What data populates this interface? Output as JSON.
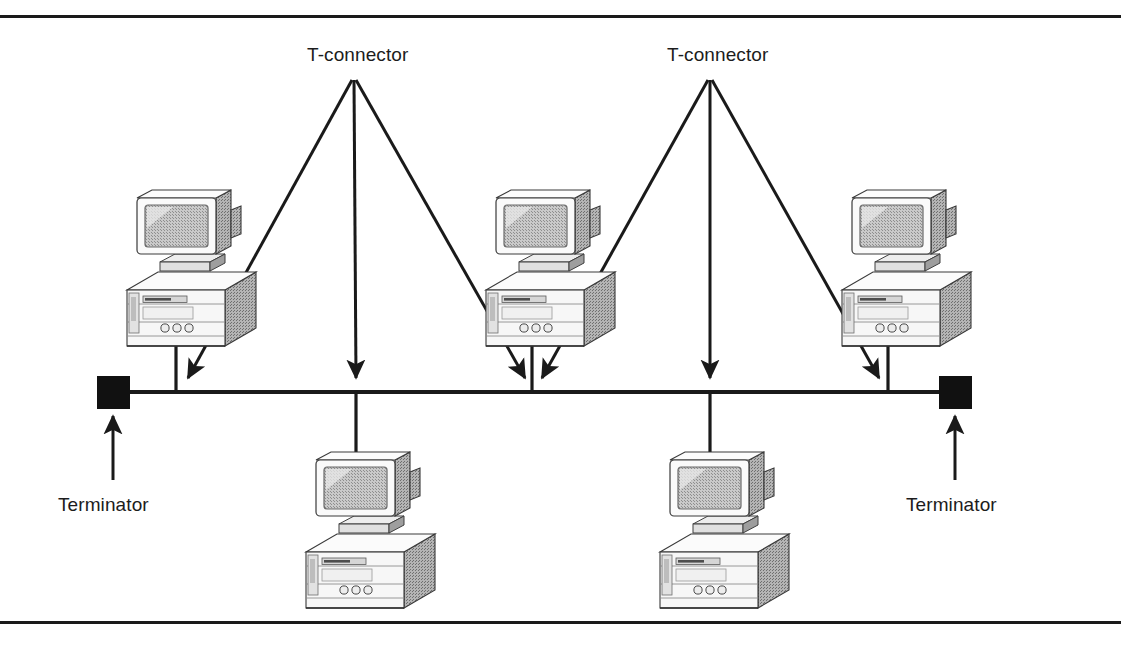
{
  "figure": {
    "background_color": "#ffffff",
    "line_color": "#1a1a1a",
    "border": {
      "top_rule": true,
      "bottom_rule": true
    }
  },
  "labels": {
    "t_connector_left": "T-connector",
    "t_connector_right": "T-connector",
    "terminator_left": "Terminator",
    "terminator_right": "Terminator"
  },
  "diagram_data": {
    "type": "network-topology",
    "topology": "bus",
    "bus": {
      "y": 392,
      "x_start": 113,
      "x_end": 948,
      "stroke_width": 4
    },
    "terminators": [
      {
        "name": "terminator-left",
        "x": 97,
        "y": 376,
        "size": 33,
        "fill": "#111111"
      },
      {
        "name": "terminator-right",
        "x": 939,
        "y": 376,
        "size": 33,
        "fill": "#111111"
      }
    ],
    "computers": [
      {
        "name": "computer-top-left",
        "x": 113,
        "y": 190,
        "row": "top",
        "drop_x": 176,
        "drop_from_y": 330,
        "drop_to_y": 392
      },
      {
        "name": "computer-top-middle",
        "x": 478,
        "y": 190,
        "row": "top",
        "drop_x": 532,
        "drop_from_y": 330,
        "drop_to_y": 392
      },
      {
        "name": "computer-top-right",
        "x": 833,
        "y": 190,
        "row": "top",
        "drop_x": 888,
        "drop_from_y": 330,
        "drop_to_y": 392
      },
      {
        "name": "computer-bottom-left",
        "x": 290,
        "y": 452,
        "row": "bottom",
        "drop_x": 356,
        "drop_from_y": 392,
        "drop_to_y": 470
      },
      {
        "name": "computer-bottom-right",
        "x": 655,
        "y": 452,
        "row": "bottom",
        "drop_x": 710,
        "drop_from_y": 392,
        "drop_to_y": 470
      }
    ],
    "t_connectors": [
      {
        "name": "t-connector-left",
        "apex_x": 352,
        "apex_y": 78,
        "arrows": [
          {
            "to_x": 186,
            "to_y": 380
          },
          {
            "to_x": 356,
            "to_y": 380
          },
          {
            "to_x": 527,
            "to_y": 380
          }
        ]
      },
      {
        "name": "t-connector-right",
        "apex_x": 712,
        "apex_y": 78,
        "arrows": [
          {
            "to_x": 540,
            "to_y": 380
          },
          {
            "to_x": 710,
            "to_y": 380
          },
          {
            "to_x": 881,
            "to_y": 380
          }
        ]
      }
    ],
    "terminator_pointers": [
      {
        "name": "terminator-pointer-left",
        "from_x": 113,
        "from_y": 478,
        "to_x": 113,
        "to_y": 414
      },
      {
        "name": "terminator-pointer-right",
        "from_x": 955,
        "from_y": 478,
        "to_x": 955,
        "to_y": 414
      }
    ],
    "label_positions": {
      "t_connector_left": {
        "x": 307,
        "y": 44
      },
      "t_connector_right": {
        "x": 667,
        "y": 44
      },
      "terminator_left": {
        "x": 58,
        "y": 494
      },
      "terminator_right": {
        "x": 906,
        "y": 494
      }
    }
  }
}
